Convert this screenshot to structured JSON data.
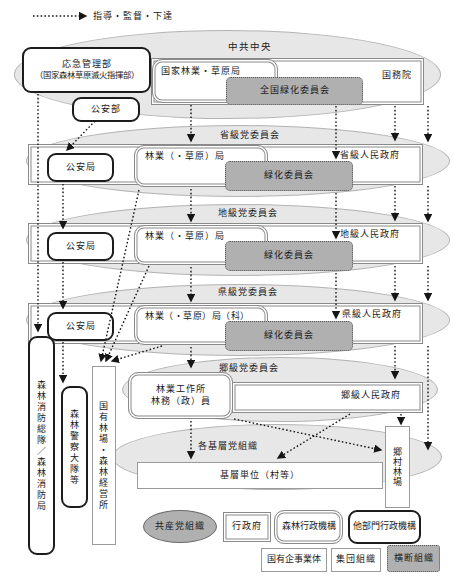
{
  "arrow_legend": {
    "label": "指導・監督・下達"
  },
  "central": {
    "party_label": "中共中央",
    "emergency_line1": "応急管理部",
    "emergency_line2": "（国家森林草原滅火指揮部）",
    "forestry_bureau": "国家林業・草原局",
    "state_council": "国務院",
    "national_greening": "全国緑化委員会",
    "public_security": "公安部"
  },
  "province": {
    "party_label": "省級党委員会",
    "public_security": "公安局",
    "forestry": "林業（・草原）局",
    "government": "省級人民政府",
    "greening": "緑化委員会"
  },
  "prefecture": {
    "party_label": "地級党委員会",
    "public_security": "公安局",
    "forestry": "林業（・草原）局",
    "government": "地級人民政府",
    "greening": "緑化委員会"
  },
  "county": {
    "party_label": "県級党委員会",
    "public_security": "公安局",
    "forestry": "林業（・草原）局（科）",
    "government": "県級人民政府",
    "greening": "緑化委員会"
  },
  "township": {
    "party_label": "郷級党委員会",
    "station_line1": "林業工作所",
    "station_line2": "林務（政）員",
    "government": "郷級人民政府"
  },
  "grassroots": {
    "party_label": "各基層党組織",
    "base_unit": "基層単位（村等）",
    "village_farm": "郷村林場"
  },
  "left_column": {
    "fire_brigade": "森林消防総隊／森林消防局",
    "forest_police": "森林警察大隊等",
    "state_forest_farm": "国有林場・森林経営所"
  },
  "legend": {
    "party": "共産党組織",
    "government": "行政府",
    "forest_admin": "森林行政機構",
    "other_admin": "他部門行政機構",
    "state_enterprise": "国有企事業体",
    "collective": "集団組織",
    "cross_org": "横断組織"
  },
  "colors": {
    "gray_fill": "#b0b0b0",
    "ellipse_fill": "#e7e7e7",
    "arrow": "#161616"
  }
}
